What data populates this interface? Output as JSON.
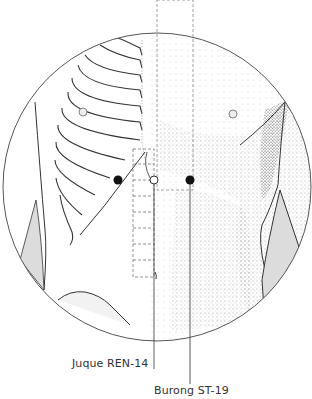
{
  "diagram": {
    "colors": {
      "outline": "#333333",
      "point_fill": "#111111",
      "hollow_point_fill": "#ffffff",
      "shading": "#d9d9d9",
      "guide_dashed": "#777777"
    },
    "points": [
      {
        "id": "burong-left",
        "style": "filled",
        "x": 118,
        "y": 180
      },
      {
        "id": "juque",
        "style": "hollow",
        "x": 154,
        "y": 180
      },
      {
        "id": "burong-right",
        "style": "filled",
        "x": 190,
        "y": 180
      }
    ],
    "labels": [
      {
        "id": "juque-label",
        "text": "Juque REN-14"
      },
      {
        "id": "burong-label",
        "text": "Burong ST-19"
      }
    ]
  }
}
